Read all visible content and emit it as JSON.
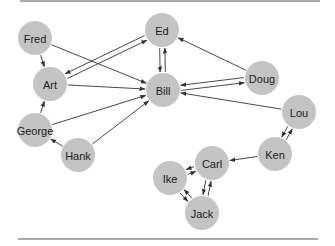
{
  "diagram": {
    "type": "directed-graph",
    "nodes": [
      {
        "id": "fred",
        "label": "Fred",
        "x": 35,
        "y": 38
      },
      {
        "id": "art",
        "label": "Art",
        "x": 50,
        "y": 84
      },
      {
        "id": "george",
        "label": "George",
        "x": 35,
        "y": 130
      },
      {
        "id": "hank",
        "label": "Hank",
        "x": 78,
        "y": 155
      },
      {
        "id": "ed",
        "label": "Ed",
        "x": 162,
        "y": 30
      },
      {
        "id": "bill",
        "label": "Bill",
        "x": 163,
        "y": 90
      },
      {
        "id": "doug",
        "label": "Doug",
        "x": 262,
        "y": 78
      },
      {
        "id": "lou",
        "label": "Lou",
        "x": 299,
        "y": 112
      },
      {
        "id": "ken",
        "label": "Ken",
        "x": 275,
        "y": 154
      },
      {
        "id": "carl",
        "label": "Carl",
        "x": 212,
        "y": 163
      },
      {
        "id": "ike",
        "label": "Ike",
        "x": 170,
        "y": 178
      },
      {
        "id": "jack",
        "label": "Jack",
        "x": 202,
        "y": 213
      }
    ],
    "edges": [
      {
        "from": "fred",
        "to": "art"
      },
      {
        "from": "fred",
        "to": "bill"
      },
      {
        "from": "art",
        "to": "ed"
      },
      {
        "from": "ed",
        "to": "art"
      },
      {
        "from": "art",
        "to": "bill"
      },
      {
        "from": "george",
        "to": "art"
      },
      {
        "from": "george",
        "to": "bill"
      },
      {
        "from": "hank",
        "to": "george"
      },
      {
        "from": "hank",
        "to": "bill"
      },
      {
        "from": "ed",
        "to": "bill"
      },
      {
        "from": "bill",
        "to": "ed"
      },
      {
        "from": "doug",
        "to": "ed"
      },
      {
        "from": "bill",
        "to": "doug"
      },
      {
        "from": "doug",
        "to": "bill"
      },
      {
        "from": "lou",
        "to": "bill"
      },
      {
        "from": "lou",
        "to": "ken"
      },
      {
        "from": "ken",
        "to": "lou"
      },
      {
        "from": "ken",
        "to": "carl"
      },
      {
        "from": "carl",
        "to": "ike"
      },
      {
        "from": "ike",
        "to": "carl"
      },
      {
        "from": "carl",
        "to": "jack"
      },
      {
        "from": "jack",
        "to": "carl"
      },
      {
        "from": "ike",
        "to": "jack"
      },
      {
        "from": "jack",
        "to": "ike"
      }
    ],
    "node_radius": 17,
    "colors": {
      "node_fill": "#c4c4c4",
      "edge": "#333333",
      "label": "#1a1a1a",
      "rule": "#555555"
    }
  }
}
